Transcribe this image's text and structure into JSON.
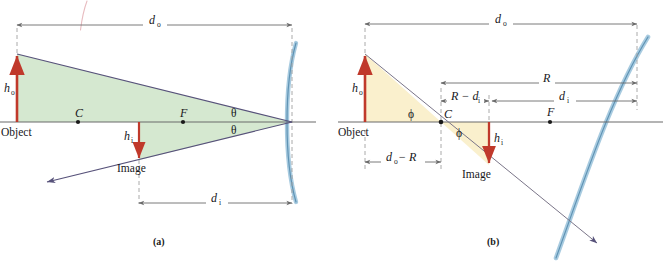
{
  "figure": {
    "type": "optics-ray-diagram",
    "background": "#ffffff"
  },
  "colors": {
    "mirror": "#8fb8d4",
    "mirror_core": "#5b8fb0",
    "axis": "#6b6b6b",
    "ray": "#6f6a8f",
    "arrow_red": "#c0392b",
    "fill_green": "#d5e8d0",
    "fill_yellow": "#faf0cd",
    "dim_line": "#6b6b6b",
    "dashed": "#9a9a9a",
    "text": "#17171b",
    "scribble": "#e7b9bd"
  },
  "panels": [
    {
      "id": "a",
      "caption": "(a)",
      "fill_color": "#d5e8d0",
      "axis_label": "Object",
      "image_label": "Image",
      "heights": [
        {
          "name": "object-height",
          "symbol": "h",
          "subscript": "o",
          "direction": "up"
        },
        {
          "name": "image-height",
          "symbol": "h",
          "subscript": "i",
          "direction": "down"
        }
      ],
      "axis_points": [
        {
          "name": "center-of-curvature",
          "label": "C"
        },
        {
          "name": "focal-point",
          "label": "F"
        }
      ],
      "angles": [
        {
          "name": "theta-upper",
          "label": "θ"
        },
        {
          "name": "theta-lower",
          "label": "θ"
        }
      ],
      "dimensions": [
        {
          "name": "object-distance",
          "symbol": "d",
          "subscript": "o",
          "position": "top"
        },
        {
          "name": "image-distance",
          "symbol": "d",
          "subscript": "i",
          "position": "bottom"
        }
      ]
    },
    {
      "id": "b",
      "caption": "(b)",
      "fill_color": "#faf0cd",
      "axis_label": "Object",
      "image_label": "Image",
      "heights": [
        {
          "name": "object-height",
          "symbol": "h",
          "subscript": "o",
          "direction": "up"
        },
        {
          "name": "image-height",
          "symbol": "h",
          "subscript": "i",
          "direction": "down"
        }
      ],
      "axis_points": [
        {
          "name": "center-of-curvature",
          "label": "C"
        },
        {
          "name": "focal-point",
          "label": "F"
        }
      ],
      "angles": [
        {
          "name": "phi-left",
          "label": "ϕ"
        },
        {
          "name": "phi-right",
          "label": "ϕ"
        }
      ],
      "dimensions": [
        {
          "name": "object-distance",
          "symbol": "d",
          "subscript": "o",
          "position": "top"
        },
        {
          "name": "radius-of-curvature",
          "symbol": "R",
          "subscript": "",
          "position": "upper-middle"
        },
        {
          "name": "image-distance",
          "symbol": "d",
          "subscript": "i",
          "position": "middle"
        },
        {
          "name": "r-minus-di",
          "symbol": "R − d",
          "subscript": "i",
          "position": "middle-left"
        },
        {
          "name": "do-minus-r",
          "symbol": "d",
          "subscript": "o",
          "suffix": " − R",
          "position": "below"
        }
      ]
    }
  ]
}
